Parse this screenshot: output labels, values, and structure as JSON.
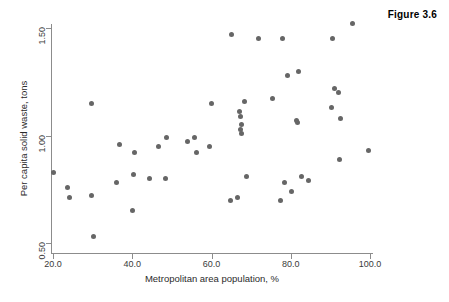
{
  "figure": {
    "title": "Figure 3.6"
  },
  "chart_data": {
    "type": "scatter",
    "title": "Figure 3.6",
    "xlabel": "Metropolitan area population, %",
    "ylabel": "Per capita solid waste, tons",
    "xlim": [
      17.5,
      102.0
    ],
    "ylim": [
      0.45,
      1.56
    ],
    "grid": false,
    "legend": null,
    "xticks": [
      20.0,
      40.0,
      60.0,
      80.0,
      100.0
    ],
    "xtick_labels": [
      "20.0",
      "40.0",
      "60.0",
      "80.0",
      "100.0"
    ],
    "yticks": [
      0.5,
      1.0,
      1.5
    ],
    "ytick_labels": [
      "0.50",
      "1.00",
      "1.50"
    ],
    "marker": {
      "shape": "circle",
      "color": "#666666",
      "size": 5
    },
    "axis_color": "#8c8c8c",
    "points": [
      {
        "x": 20.0,
        "y": 0.83
      },
      {
        "x": 23.7,
        "y": 0.76
      },
      {
        "x": 24.2,
        "y": 0.71
      },
      {
        "x": 29.6,
        "y": 0.72
      },
      {
        "x": 29.6,
        "y": 1.15
      },
      {
        "x": 30.3,
        "y": 0.53
      },
      {
        "x": 36.0,
        "y": 0.78
      },
      {
        "x": 36.7,
        "y": 0.96
      },
      {
        "x": 40.1,
        "y": 0.65
      },
      {
        "x": 40.4,
        "y": 0.82
      },
      {
        "x": 40.6,
        "y": 0.92
      },
      {
        "x": 44.3,
        "y": 0.8
      },
      {
        "x": 46.5,
        "y": 0.95
      },
      {
        "x": 48.4,
        "y": 0.8
      },
      {
        "x": 48.6,
        "y": 0.99
      },
      {
        "x": 53.9,
        "y": 0.97
      },
      {
        "x": 55.8,
        "y": 0.99
      },
      {
        "x": 56.1,
        "y": 0.92
      },
      {
        "x": 59.6,
        "y": 0.95
      },
      {
        "x": 60.0,
        "y": 1.15
      },
      {
        "x": 64.9,
        "y": 0.7
      },
      {
        "x": 66.5,
        "y": 0.71
      },
      {
        "x": 65.0,
        "y": 1.47
      },
      {
        "x": 67.0,
        "y": 1.11
      },
      {
        "x": 67.4,
        "y": 1.09
      },
      {
        "x": 67.4,
        "y": 1.03
      },
      {
        "x": 67.6,
        "y": 1.01
      },
      {
        "x": 67.6,
        "y": 1.05
      },
      {
        "x": 68.4,
        "y": 1.16
      },
      {
        "x": 68.8,
        "y": 0.81
      },
      {
        "x": 71.9,
        "y": 1.45
      },
      {
        "x": 75.3,
        "y": 1.17
      },
      {
        "x": 77.4,
        "y": 0.7
      },
      {
        "x": 78.0,
        "y": 1.45
      },
      {
        "x": 78.5,
        "y": 0.78
      },
      {
        "x": 79.1,
        "y": 1.28
      },
      {
        "x": 80.3,
        "y": 0.74
      },
      {
        "x": 81.5,
        "y": 1.07
      },
      {
        "x": 81.7,
        "y": 1.06
      },
      {
        "x": 81.9,
        "y": 1.3
      },
      {
        "x": 82.6,
        "y": 0.81
      },
      {
        "x": 84.4,
        "y": 0.79
      },
      {
        "x": 90.2,
        "y": 1.13
      },
      {
        "x": 90.6,
        "y": 1.45
      },
      {
        "x": 91.0,
        "y": 1.22
      },
      {
        "x": 92.0,
        "y": 1.2
      },
      {
        "x": 92.5,
        "y": 1.08
      },
      {
        "x": 92.2,
        "y": 0.89
      },
      {
        "x": 95.7,
        "y": 1.52
      },
      {
        "x": 99.7,
        "y": 0.93
      }
    ]
  }
}
